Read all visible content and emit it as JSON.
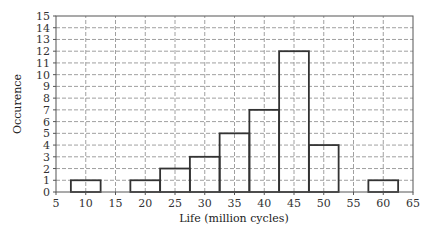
{
  "chart_data": {
    "type": "bar",
    "subtype": "histogram",
    "title": "",
    "xlabel": "Life (million cycles)",
    "ylabel": "Occurence",
    "xlim": [
      5,
      65
    ],
    "ylim": [
      0,
      15
    ],
    "x_ticks": [
      5,
      10,
      15,
      20,
      25,
      30,
      35,
      40,
      45,
      50,
      55,
      60,
      65
    ],
    "y_ticks": [
      0,
      1,
      2,
      3,
      4,
      5,
      6,
      7,
      8,
      9,
      10,
      11,
      12,
      13,
      14,
      15
    ],
    "grid": true,
    "grid_style": "dashed",
    "bin_width": 5,
    "categories": [
      10,
      20,
      25,
      30,
      35,
      40,
      45,
      50,
      60
    ],
    "values": [
      1,
      1,
      2,
      3,
      5,
      7,
      12,
      4,
      1
    ],
    "bins": [
      {
        "from": 7.5,
        "to": 12.5,
        "count": 1
      },
      {
        "from": 17.5,
        "to": 22.5,
        "count": 1
      },
      {
        "from": 22.5,
        "to": 27.5,
        "count": 2
      },
      {
        "from": 27.5,
        "to": 32.5,
        "count": 3
      },
      {
        "from": 32.5,
        "to": 37.5,
        "count": 5
      },
      {
        "from": 37.5,
        "to": 42.5,
        "count": 7
      },
      {
        "from": 42.5,
        "to": 47.5,
        "count": 12
      },
      {
        "from": 47.5,
        "to": 52.5,
        "count": 4
      },
      {
        "from": 57.5,
        "to": 62.5,
        "count": 1
      }
    ],
    "legend": null
  },
  "colors": {
    "bar_stroke": "#333333",
    "grid": "#888888",
    "axis": "#555555"
  }
}
